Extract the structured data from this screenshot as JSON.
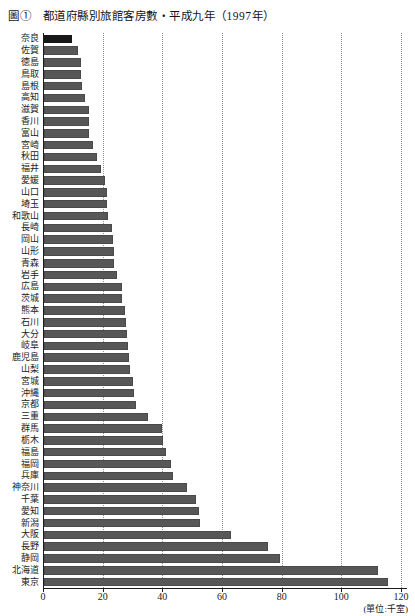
{
  "title": "圖①　都道府縣別旅館客房數・平成九年（1997年）",
  "unit_label": "(單位:千室)",
  "colors": {
    "bar": "#575757",
    "first_bar": "#181818",
    "axis": "#1c1c1c",
    "gridline": "#8f8f8f",
    "background": "#ffffff"
  },
  "chart_data": {
    "type": "bar",
    "orientation": "horizontal",
    "title": "圖①　都道府縣別旅館客房數・平成九年（1997年）",
    "unit": "千室",
    "xlabel": "(單位:千室)",
    "xlim": [
      0,
      120
    ],
    "xticks": [
      0,
      20,
      40,
      60,
      80,
      100,
      120
    ],
    "grid": "vertical-dotted",
    "categories": [
      "奈良",
      "佐賀",
      "徳島",
      "鳥取",
      "島根",
      "高知",
      "滋賀",
      "香川",
      "富山",
      "宮崎",
      "秋田",
      "福井",
      "愛媛",
      "山口",
      "埼玉",
      "和歌山",
      "長崎",
      "岡山",
      "山形",
      "青森",
      "岩手",
      "広島",
      "茨城",
      "熊本",
      "石川",
      "大分",
      "岐阜",
      "鹿児島",
      "山梨",
      "宮城",
      "沖縄",
      "京都",
      "三重",
      "群馬",
      "栃木",
      "福島",
      "福岡",
      "兵庫",
      "神奈川",
      "千葉",
      "愛知",
      "新潟",
      "大阪",
      "長野",
      "静岡",
      "北海道",
      "東京"
    ],
    "values": [
      9.5,
      11.4,
      12.3,
      12.5,
      12.8,
      13.6,
      15.0,
      15.1,
      15.2,
      16.3,
      17.7,
      19.1,
      20.4,
      21.0,
      21.2,
      21.3,
      22.7,
      23.0,
      23.4,
      23.6,
      24.5,
      26.0,
      26.3,
      27.3,
      27.5,
      27.9,
      28.2,
      28.4,
      28.8,
      29.9,
      30.3,
      30.8,
      34.8,
      39.7,
      40.0,
      40.9,
      42.7,
      43.1,
      47.8,
      51.1,
      52.1,
      52.3,
      62.7,
      75.2,
      79.2,
      112.1,
      115.2
    ]
  }
}
